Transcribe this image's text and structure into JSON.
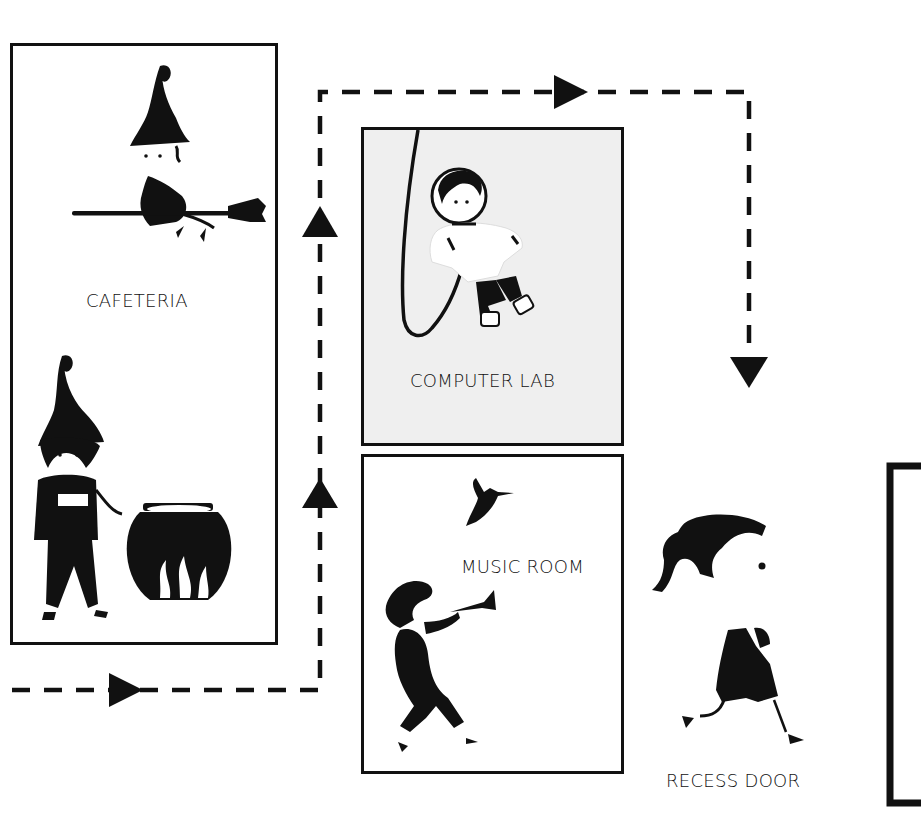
{
  "diagram": {
    "colors": {
      "ink": "#111111",
      "lab_fill": "#efefef",
      "background": "#ffffff"
    },
    "rooms": [
      {
        "id": "cafeteria",
        "label": "CAFETERIA",
        "illustrations": [
          "witch-on-broom",
          "witch-with-cauldron"
        ]
      },
      {
        "id": "computer-lab",
        "label": "COMPUTER LAB",
        "illustrations": [
          "astronaut-with-tether"
        ]
      },
      {
        "id": "music-room",
        "label": "MUSIC ROOM",
        "illustrations": [
          "hummingbird",
          "trumpet-player"
        ]
      },
      {
        "id": "recess-door",
        "label": "RECESS DOOR",
        "illustrations": [
          "running-girl",
          "door-frame"
        ]
      }
    ],
    "path": {
      "style": "dashed",
      "arrows": [
        "right",
        "up",
        "up",
        "right",
        "down"
      ],
      "sequence": [
        "Cafeteria",
        "Music Room",
        "Computer Lab",
        "Recess Door"
      ]
    }
  }
}
